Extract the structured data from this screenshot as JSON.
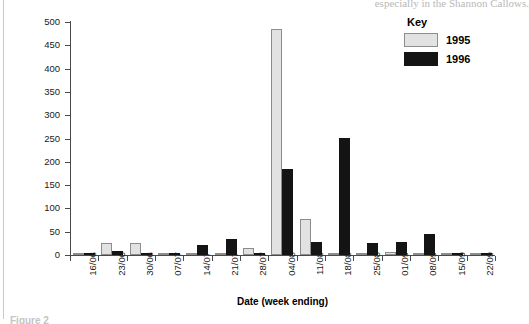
{
  "page": {
    "top_bleed_text": "especially in the Shannon Callows.",
    "figure_caption": "Figure 2"
  },
  "legend": {
    "title": "Key",
    "entries": [
      {
        "label": "1995",
        "color": "#e2e2e2"
      },
      {
        "label": "1996",
        "color": "#141414"
      }
    ]
  },
  "chart_data": {
    "type": "bar",
    "title": "",
    "xlabel": "Date (week ending)",
    "ylabel": "Area mown (ha)",
    "ylim": [
      0,
      500
    ],
    "yticks": [
      0,
      50,
      100,
      150,
      200,
      250,
      300,
      350,
      400,
      450,
      500
    ],
    "ytick_labels": [
      "0",
      "50",
      "100",
      "150",
      "200",
      "250",
      "300",
      "350",
      "400",
      "450",
      "500"
    ],
    "grid": false,
    "legend_position": "top-right",
    "categories": [
      "16/06",
      "23/06",
      "30/06",
      "07/07",
      "14/07",
      "21/07",
      "28/07",
      "04/08",
      "11/08",
      "18/08",
      "25/08",
      "01/09",
      "08/09",
      "15/09",
      "22/09"
    ],
    "series": [
      {
        "name": "1995",
        "color": "#e2e2e2",
        "values": [
          0,
          26,
          25,
          0,
          4,
          1,
          14,
          485,
          77,
          1,
          1,
          7,
          4,
          0,
          0
        ]
      },
      {
        "name": "1996",
        "color": "#141414",
        "values": [
          0,
          8,
          2,
          0,
          22,
          34,
          0,
          185,
          27,
          251,
          25,
          28,
          45,
          0,
          1
        ]
      }
    ]
  }
}
